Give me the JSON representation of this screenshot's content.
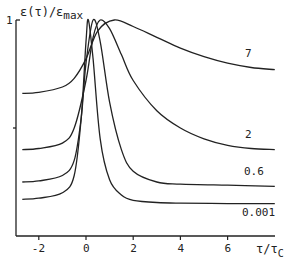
{
  "chart_data": {
    "type": "line",
    "title": "",
    "xlabel": "τ/τc",
    "ylabel": "ε(τ)/εmax",
    "xlim": [
      -2.7,
      8.0
    ],
    "ylim": [
      0,
      1
    ],
    "x_ticks": [
      -2,
      0,
      2,
      4,
      6
    ],
    "y_ticks": [
      0.5,
      1
    ],
    "y_tick_labels": [
      "",
      "1"
    ],
    "grid": false,
    "legend": "inline curve labels at right",
    "series": [
      {
        "name": "7",
        "points": [
          [
            -2.7,
            0.66
          ],
          [
            -2,
            0.665
          ],
          [
            -1,
            0.69
          ],
          [
            -0.5,
            0.73
          ],
          [
            0,
            0.82
          ],
          [
            0.5,
            0.95
          ],
          [
            1.2,
            1.0
          ],
          [
            2,
            0.97
          ],
          [
            3,
            0.92
          ],
          [
            4,
            0.87
          ],
          [
            5,
            0.83
          ],
          [
            6,
            0.8
          ],
          [
            7,
            0.78
          ],
          [
            8,
            0.77
          ]
        ]
      },
      {
        "name": "2",
        "points": [
          [
            -2.7,
            0.4
          ],
          [
            -2,
            0.405
          ],
          [
            -1,
            0.43
          ],
          [
            -0.5,
            0.5
          ],
          [
            0,
            0.72
          ],
          [
            0.3,
            0.92
          ],
          [
            0.6,
            1.0
          ],
          [
            1,
            0.96
          ],
          [
            1.5,
            0.84
          ],
          [
            2,
            0.72
          ],
          [
            3,
            0.58
          ],
          [
            4,
            0.5
          ],
          [
            5,
            0.45
          ],
          [
            6,
            0.42
          ],
          [
            7,
            0.405
          ],
          [
            8,
            0.4
          ]
        ]
      },
      {
        "name": "0.6",
        "points": [
          [
            -2.7,
            0.25
          ],
          [
            -2,
            0.255
          ],
          [
            -1,
            0.28
          ],
          [
            -0.5,
            0.35
          ],
          [
            -0.2,
            0.55
          ],
          [
            0,
            0.8
          ],
          [
            0.3,
            1.0
          ],
          [
            0.6,
            0.9
          ],
          [
            1,
            0.62
          ],
          [
            1.5,
            0.4
          ],
          [
            2,
            0.3
          ],
          [
            3,
            0.25
          ],
          [
            4,
            0.24
          ],
          [
            6,
            0.235
          ],
          [
            8,
            0.23
          ]
        ]
      },
      {
        "name": "0.001",
        "points": [
          [
            -2.7,
            0.17
          ],
          [
            -2,
            0.175
          ],
          [
            -1,
            0.2
          ],
          [
            -0.5,
            0.28
          ],
          [
            -0.2,
            0.55
          ],
          [
            0,
            0.9
          ],
          [
            0.1,
            1.0
          ],
          [
            0.3,
            0.82
          ],
          [
            0.6,
            0.45
          ],
          [
            1,
            0.26
          ],
          [
            1.5,
            0.19
          ],
          [
            2,
            0.165
          ],
          [
            3,
            0.155
          ],
          [
            4,
            0.152
          ],
          [
            6,
            0.15
          ],
          [
            8,
            0.15
          ]
        ]
      }
    ],
    "curve_labels": [
      {
        "text": "7",
        "x": 6.7,
        "y": 0.84
      },
      {
        "text": "2",
        "x": 6.6,
        "y": 0.47
      },
      {
        "text": "0.6",
        "x": 6.3,
        "y": 0.3
      },
      {
        "text": "0.001",
        "x": 6.1,
        "y": 0.09
      }
    ]
  },
  "axis": {
    "y_label": "ε(τ)/ε",
    "y_label_sub": "max",
    "y_top_tick": "1",
    "x_label": "τ/τ",
    "x_label_sub": "C",
    "x_tick_labels": [
      "-2",
      "0",
      "2",
      "4",
      "6"
    ]
  },
  "labels": {
    "c7": "7",
    "c2": "2",
    "c06": "0.6",
    "c0001": "0.001"
  }
}
